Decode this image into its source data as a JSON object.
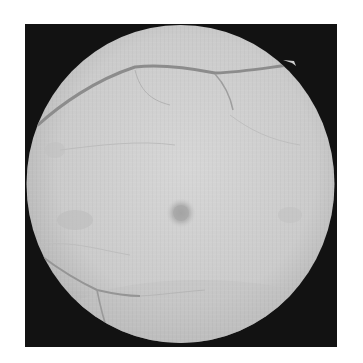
{
  "image": {
    "type": "fundus-photograph",
    "description": "Grayscale retinal fundus image on a black square background",
    "colors": {
      "page_background": "#ffffff",
      "frame": "#121212",
      "retina_center": "#d4d4d4",
      "retina_edge": "#b4b4b4",
      "vessel": "#8a8a8a",
      "fovea": "#a2a2a2"
    },
    "features": [
      {
        "name": "retina-disc",
        "center": [
          180.5,
          184
        ],
        "radii": [
          154,
          159
        ]
      },
      {
        "name": "fovea",
        "center": [
          181,
          213
        ],
        "radius": 13
      },
      {
        "name": "superior-arcade-vessel"
      },
      {
        "name": "inferior-vessels"
      },
      {
        "name": "notch-top-right",
        "position": [
          293,
          62
        ]
      }
    ]
  }
}
